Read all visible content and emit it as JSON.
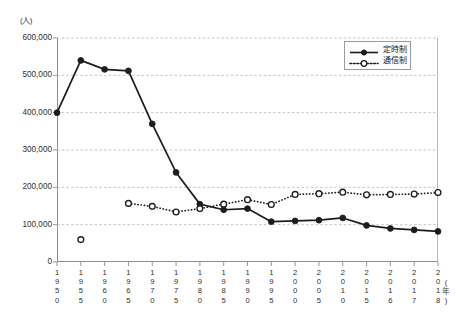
{
  "axes": {
    "y_unit_label": "(人)",
    "x_unit_label": "(年)",
    "y_tick_labels": [
      "600,000",
      "500,000",
      "400,000",
      "300,000",
      "200,000",
      "100,000",
      "0"
    ]
  },
  "legend": {
    "items": [
      {
        "label": "定時制",
        "marker": "filled-circle",
        "line": "solid"
      },
      {
        "label": "通信制",
        "marker": "open-circle",
        "line": "dotted"
      }
    ]
  },
  "colors": {
    "line": "#1d1d1d",
    "marker_fill": "#1d1d1d",
    "marker_open_fill": "#ffffff",
    "grid": "#b5b5b5",
    "axis": "#8d8d8d",
    "text": "#2f2f2f"
  },
  "chart_data": {
    "type": "line",
    "title": "",
    "xlabel": "(年)",
    "ylabel": "(人)",
    "ylim": [
      0,
      600000
    ],
    "ytick_step": 100000,
    "grid": true,
    "legend_position": "top-right",
    "categories": [
      "1950",
      "1955",
      "1960",
      "1965",
      "1970",
      "1975",
      "1980",
      "1985",
      "1990",
      "1995",
      "2000",
      "2005",
      "2010",
      "2015",
      "2016",
      "2017",
      "2018"
    ],
    "series": [
      {
        "name": "定時制",
        "marker": "filled-circle",
        "line": "solid",
        "values": [
          400000,
          540000,
          516000,
          512000,
          370000,
          240000,
          155000,
          140000,
          143000,
          108000,
          110000,
          112000,
          118000,
          98000,
          90000,
          86000,
          82000
        ]
      },
      {
        "name": "通信制",
        "marker": "open-circle",
        "line": "dotted",
        "values": [
          null,
          60000,
          null,
          157000,
          149000,
          134000,
          143000,
          155000,
          167000,
          154000,
          181000,
          183000,
          187000,
          180000,
          181000,
          182000,
          186000
        ]
      }
    ],
    "notes": [
      "通信制 at 1955 is an isolated open-circle marker with no connecting line",
      "通信制 connected line begins at 1965"
    ]
  }
}
